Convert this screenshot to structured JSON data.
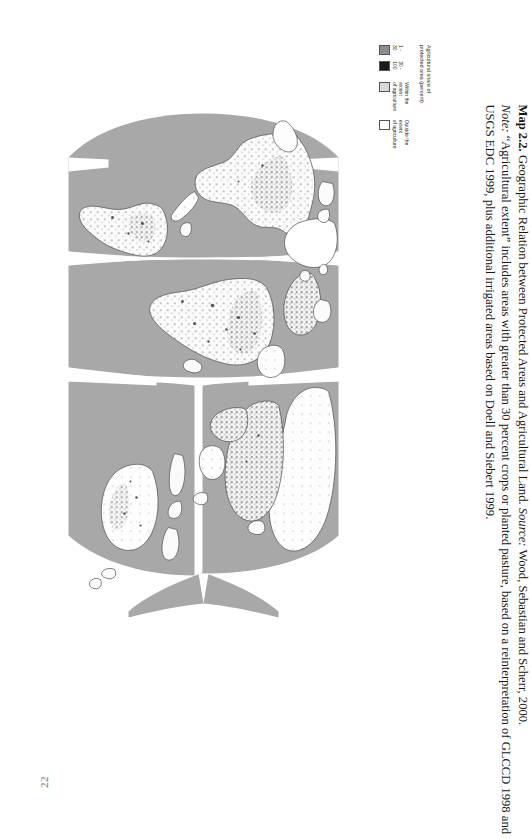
{
  "page": {
    "number": "22",
    "background_color": "#ffffff"
  },
  "map": {
    "title_alt": "Geographic Relation between Protected Areas and Agricultural Land",
    "projection": "interrupted Goode homolosine",
    "ocean_color": "#a8a8a8",
    "land_color": "#fefefe",
    "coastline_color": "#4a4a4a",
    "rotation_degrees": 90
  },
  "legend": {
    "title": "Agricultural share of\nprotected area (percent)",
    "entries": [
      {
        "label": "1 - 30",
        "color": "#8d8d8d"
      },
      {
        "label": "30 - 100",
        "color": "#1a1a1a"
      },
      {
        "label": "Within the extent\nof agriculture",
        "color": "#d9d9d9"
      },
      {
        "label": "Outside the extent\nof agriculture",
        "color": "#ffffff"
      }
    ]
  },
  "caption": {
    "map_label": "Map 2.2.",
    "title": "Geographic Relation between Protected Areas and Agricultural Land.",
    "source_label": "Source:",
    "source_text": "Wood, Sebastian and Scherr, 2000.",
    "note_label": "Note:",
    "note_line1": "“Agricultural extent” includes areas with greater than 30 percent crops or planted pasture, based on a reinterpretation of GLCCD 1998 and",
    "note_line2": "USGS EDC 1999, plus additional irrigated areas based on Doell and Siebert 1999.",
    "line1_plain": "Geographic Relation between Protected Areas and Agricultural Land.",
    "line2_plain": "“Agricultural extent” includes areas with greater than 30 percent crops or planted pasture, based on a reinterpretation of GLCCD 1998 and",
    "line3_plain": "USGS EDC 1999, plus additional irrigated areas based on Doell and Siebert 1999."
  }
}
